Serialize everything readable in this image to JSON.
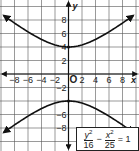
{
  "chart_data": {
    "type": "line",
    "title": "",
    "xlabel": "x",
    "ylabel": "y",
    "xlim": [
      -10,
      10
    ],
    "ylim": [
      -11,
      10
    ],
    "grid": true,
    "grid_step": 2,
    "x_ticks": [
      "-8",
      "-6",
      "-4",
      "-2",
      "2",
      "4",
      "6",
      "8"
    ],
    "y_ticks": [
      "8",
      "6",
      "4",
      "2",
      "-2",
      "-4",
      "-6",
      "-8"
    ],
    "origin_label": "O",
    "series": [
      {
        "name": "upper branch",
        "equation": "y = 4*sqrt(1 + x^2/25)",
        "vertex": [
          0,
          4
        ],
        "points": [
          [
            -9.5,
            8.6
          ],
          [
            -8,
            7.5
          ],
          [
            -6,
            6.2
          ],
          [
            -4,
            5.1
          ],
          [
            -2,
            4.3
          ],
          [
            0,
            4
          ],
          [
            2,
            4.3
          ],
          [
            4,
            5.1
          ],
          [
            6,
            6.2
          ],
          [
            8,
            7.5
          ],
          [
            9.5,
            8.6
          ]
        ],
        "arrows": true
      },
      {
        "name": "lower branch",
        "equation": "y = -4*sqrt(1 + x^2/25)",
        "vertex": [
          0,
          -4
        ],
        "points": [
          [
            -9.5,
            -8.6
          ],
          [
            -8,
            -7.5
          ],
          [
            -6,
            -6.2
          ],
          [
            -4,
            -5.1
          ],
          [
            -2,
            -4.3
          ],
          [
            0,
            -4
          ],
          [
            2,
            -4.3
          ],
          [
            4,
            -5.1
          ],
          [
            6,
            -6.2
          ],
          [
            8,
            -7.5
          ],
          [
            9.5,
            -8.6
          ]
        ],
        "arrows": true
      }
    ],
    "annotation": {
      "equation": "y^2/16 - x^2/25 = 1",
      "term1_num": "y",
      "term1_den": "16",
      "term2_num": "x",
      "term2_den": "25",
      "operator": "−",
      "rhs": "= 1",
      "exponent": "2"
    }
  }
}
